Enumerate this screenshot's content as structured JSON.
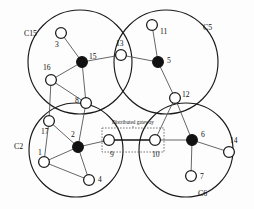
{
  "figure": {
    "annotation": "Distributed gateway",
    "colors": {
      "boundary": "#1a1a1a",
      "edge": "#4a4a4a",
      "gateway_edge": "#111111",
      "node_fill": "#ffffff",
      "head_fill": "#111111",
      "background": "#fdfdfd"
    }
  },
  "clusters": [
    {
      "id": "c15",
      "label": "C15",
      "cx": 80,
      "cy": 62,
      "r": 52,
      "label_x": 24,
      "label_y": 36
    },
    {
      "id": "c5",
      "label": "C5",
      "cx": 166,
      "cy": 62,
      "r": 52,
      "label_x": 203,
      "label_y": 30
    },
    {
      "id": "c2",
      "label": "C2",
      "cx": 76,
      "cy": 150,
      "r": 47,
      "label_x": 14,
      "label_y": 149
    },
    {
      "id": "c6",
      "label": "C6",
      "cx": 186,
      "cy": 150,
      "r": 47,
      "label_x": 198,
      "label_y": 196
    }
  ],
  "nodes": [
    {
      "id": "n3",
      "label": "3",
      "x": 61,
      "y": 33,
      "r": 5.4,
      "type": "member",
      "label_x": 55,
      "label_y": 47
    },
    {
      "id": "n15",
      "label": "15",
      "x": 82,
      "y": 62,
      "r": 5.4,
      "type": "cluster-head",
      "label_x": 89,
      "label_y": 59
    },
    {
      "id": "n16",
      "label": "16",
      "x": 51,
      "y": 80,
      "r": 5.4,
      "type": "member",
      "label_x": 43,
      "label_y": 70
    },
    {
      "id": "n8",
      "label": "8",
      "x": 86,
      "y": 103,
      "r": 5.4,
      "type": "member",
      "label_x": 75,
      "label_y": 103
    },
    {
      "id": "n13",
      "label": "13",
      "x": 121,
      "y": 55,
      "r": 5.4,
      "type": "member",
      "label_x": 116,
      "label_y": 46
    },
    {
      "id": "n11",
      "label": "11",
      "x": 152,
      "y": 25,
      "r": 5.4,
      "type": "member",
      "label_x": 160,
      "label_y": 34
    },
    {
      "id": "n5",
      "label": "5",
      "x": 158,
      "y": 62,
      "r": 5.4,
      "type": "cluster-head",
      "label_x": 167,
      "label_y": 63
    },
    {
      "id": "n12",
      "label": "12",
      "x": 175,
      "y": 98,
      "r": 5.4,
      "type": "member",
      "label_x": 182,
      "label_y": 97
    },
    {
      "id": "n17",
      "label": "17",
      "x": 49,
      "y": 121,
      "r": 5.4,
      "type": "member",
      "label_x": 41,
      "label_y": 134
    },
    {
      "id": "n1",
      "label": "1",
      "x": 44,
      "y": 162,
      "r": 5.4,
      "type": "member",
      "label_x": 38,
      "label_y": 155
    },
    {
      "id": "n2",
      "label": "2",
      "x": 78,
      "y": 147,
      "r": 5.4,
      "type": "cluster-head",
      "label_x": 71,
      "label_y": 137
    },
    {
      "id": "n4",
      "label": "4",
      "x": 89,
      "y": 180,
      "r": 5.4,
      "type": "member",
      "label_x": 98,
      "label_y": 182
    },
    {
      "id": "n9",
      "label": "9",
      "x": 109,
      "y": 140,
      "r": 5.4,
      "type": "gateway",
      "label_x": 110,
      "label_y": 157
    },
    {
      "id": "n10",
      "label": "10",
      "x": 155,
      "y": 140,
      "r": 5.4,
      "type": "gateway",
      "label_x": 152,
      "label_y": 157
    },
    {
      "id": "n6",
      "label": "6",
      "x": 192,
      "y": 140,
      "r": 5.4,
      "type": "cluster-head",
      "label_x": 201,
      "label_y": 137
    },
    {
      "id": "n14",
      "label": "14",
      "x": 229,
      "y": 152,
      "r": 5.4,
      "type": "member",
      "label_x": 230,
      "label_y": 143
    },
    {
      "id": "n7",
      "label": "7",
      "x": 191,
      "y": 176,
      "r": 5.4,
      "type": "member",
      "label_x": 200,
      "label_y": 179
    }
  ],
  "edges": [
    {
      "from": "n3",
      "to": "n15",
      "kind": "normal"
    },
    {
      "from": "n16",
      "to": "n15",
      "kind": "normal"
    },
    {
      "from": "n8",
      "to": "n15",
      "kind": "normal"
    },
    {
      "from": "n15",
      "to": "n13",
      "kind": "normal"
    },
    {
      "from": "n13",
      "to": "n5",
      "kind": "normal"
    },
    {
      "from": "n11",
      "to": "n5",
      "kind": "normal"
    },
    {
      "from": "n5",
      "to": "n12",
      "kind": "normal"
    },
    {
      "from": "n12",
      "to": "n6",
      "kind": "normal"
    },
    {
      "from": "n16",
      "to": "n8",
      "kind": "normal"
    },
    {
      "from": "n16",
      "to": "n17",
      "kind": "normal"
    },
    {
      "from": "n17",
      "to": "n1",
      "kind": "normal"
    },
    {
      "from": "n17",
      "to": "n2",
      "kind": "normal"
    },
    {
      "from": "n1",
      "to": "n2",
      "kind": "normal"
    },
    {
      "from": "n1",
      "to": "n4",
      "kind": "normal"
    },
    {
      "from": "n2",
      "to": "n4",
      "kind": "normal"
    },
    {
      "from": "n2",
      "to": "n8",
      "kind": "normal"
    },
    {
      "from": "n2",
      "to": "n9",
      "kind": "normal"
    },
    {
      "from": "n10",
      "to": "n12",
      "kind": "normal"
    },
    {
      "from": "n10",
      "to": "n6",
      "kind": "normal"
    },
    {
      "from": "n6",
      "to": "n14",
      "kind": "normal"
    },
    {
      "from": "n6",
      "to": "n7",
      "kind": "normal"
    },
    {
      "from": "n9",
      "to": "n10",
      "kind": "gateway"
    }
  ],
  "gateway_box": {
    "x": 102,
    "y": 128,
    "width": 62,
    "height": 24
  },
  "annotation_pos": {
    "x": 133,
    "y": 124
  }
}
